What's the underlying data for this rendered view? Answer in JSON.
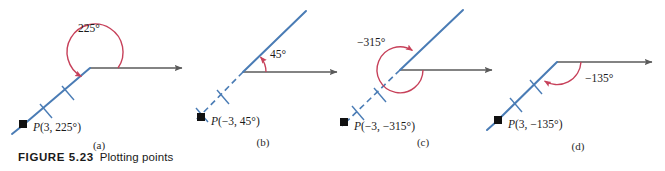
{
  "figure": {
    "number": "FIGURE 5.23",
    "caption": "Plotting points",
    "colors": {
      "ray_blue": "#4a7cb5",
      "arc_red": "#c7415a",
      "axis_gray": "#5a5a5a",
      "point_black": "#111111"
    }
  },
  "panels": [
    {
      "id": "a",
      "sublabel": "(a)",
      "angle_label": "225°",
      "point_label_p": "P",
      "point_label_coords": "(3, 225°)",
      "r_value": "3",
      "theta_value": "225°",
      "tick_count": "2",
      "ray_style": "solid",
      "angle_direction": "counterclockwise"
    },
    {
      "id": "b",
      "sublabel": "(b)",
      "angle_label": "45°",
      "point_label_p": "P",
      "point_label_coords": "(−3, 45°)",
      "r_value": "−3",
      "theta_value": "45°",
      "tick_count": "2",
      "ray_style": "dashed",
      "angle_direction": "counterclockwise"
    },
    {
      "id": "c",
      "sublabel": "(c)",
      "angle_label": "−315°",
      "point_label_p": "P",
      "point_label_coords": "(−3, −315°)",
      "r_value": "−3",
      "theta_value": "−315°",
      "tick_count": "2",
      "ray_style": "dashed",
      "angle_direction": "clockwise"
    },
    {
      "id": "d",
      "sublabel": "(d)",
      "angle_label": "−135°",
      "point_label_p": "P",
      "point_label_coords": "(3, −135°)",
      "r_value": "3",
      "theta_value": "−135°",
      "tick_count": "2",
      "ray_style": "solid",
      "angle_direction": "clockwise"
    }
  ]
}
